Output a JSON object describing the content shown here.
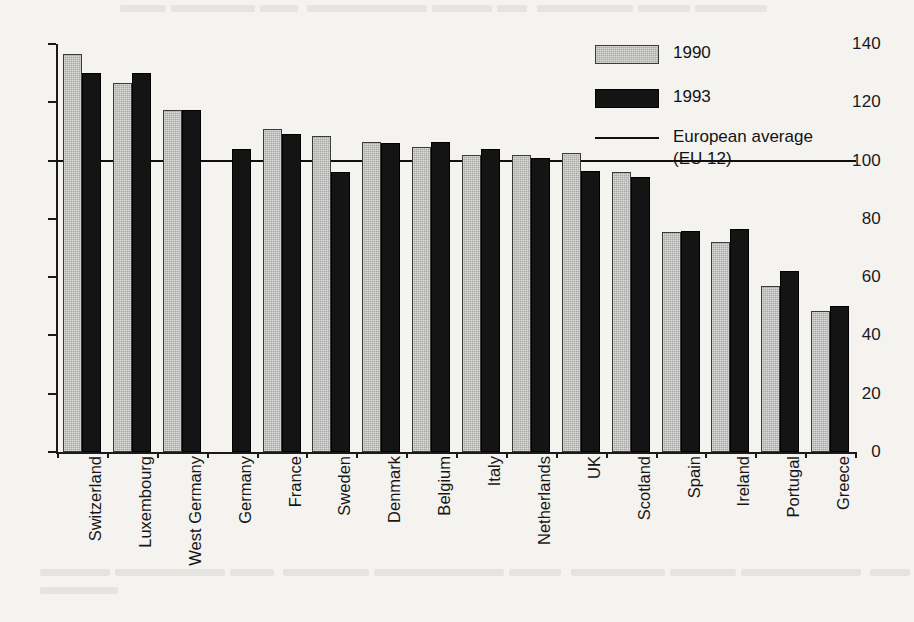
{
  "chart_data": {
    "type": "bar",
    "title": "",
    "subtitle": "",
    "xlabel": "",
    "ylabel": "",
    "ylim": [
      0,
      140
    ],
    "yticks": [
      0,
      20,
      40,
      60,
      80,
      100,
      120,
      140
    ],
    "ytick_labels": [
      "0",
      "20",
      "40",
      "60",
      "80",
      "100",
      "120",
      "140"
    ],
    "grid": false,
    "legend_position": "top-right",
    "categories": [
      "Switzerland",
      "Luxembourg",
      "West Germany",
      "Germany",
      "France",
      "Sweden",
      "Denmark",
      "Belgium",
      "Italy",
      "Netherlands",
      "UK",
      "Scotland",
      "Spain",
      "Ireland",
      "Portugal",
      "Greece"
    ],
    "series": [
      {
        "name": "1990",
        "color": "#a8a8a6",
        "values": [
          136.5,
          126.5,
          117.5,
          null,
          111,
          108.5,
          106.5,
          104.5,
          102,
          102,
          102.5,
          96,
          75.5,
          72,
          57,
          48.5
        ]
      },
      {
        "name": "1993",
        "color": "#141414",
        "values": [
          130,
          130,
          117.5,
          104,
          109,
          96,
          106,
          106.5,
          104,
          101,
          96.5,
          94.5,
          76,
          76.5,
          62,
          50
        ]
      }
    ],
    "reference_line": {
      "label": "European average",
      "sublabel": "(EU 12)",
      "value": 100,
      "color": "#101010"
    }
  },
  "legend": {
    "items": [
      {
        "label": "1990",
        "sublabel": "",
        "swatch": "filled-gray"
      },
      {
        "label": "1993",
        "sublabel": "",
        "swatch": "filled-black"
      },
      {
        "label": "European average",
        "sublabel": "(EU 12)",
        "swatch": "line"
      }
    ]
  },
  "axis": {
    "y_tick_labels": [
      "140",
      "120",
      "100",
      "80",
      "60",
      "40",
      "20",
      "0"
    ]
  }
}
